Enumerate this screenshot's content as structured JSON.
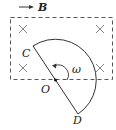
{
  "diagram": {
    "field_label": "B",
    "labels": {
      "C": "C",
      "O": "O",
      "D": "D",
      "omega": "ω"
    },
    "field_symbol": "×",
    "field_marks_count": 4,
    "colors": {
      "stroke": "#333333",
      "background": "#ffffff"
    }
  }
}
